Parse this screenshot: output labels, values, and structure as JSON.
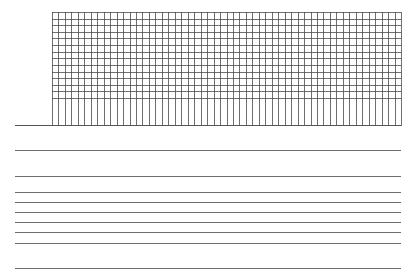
{
  "page": {
    "background": "#ffffff",
    "line_color": "#555555"
  },
  "grid": {
    "left": 52,
    "top": 12,
    "width": 349,
    "columns": 54,
    "column_spacing": 6.46,
    "rows": 13,
    "row_spacing": 6.6,
    "grid_height": 86,
    "vertical_extent": 114,
    "stroke": "#4a4a4a"
  },
  "baseline": {
    "y": 125,
    "x1": 15,
    "x2": 401
  },
  "rules": [
    {
      "y": 150
    },
    {
      "y": 176
    },
    {
      "y": 192
    },
    {
      "y": 202
    },
    {
      "y": 212
    },
    {
      "y": 222
    },
    {
      "y": 232
    },
    {
      "y": 243
    },
    {
      "y": 268
    }
  ],
  "rule_width": 386
}
